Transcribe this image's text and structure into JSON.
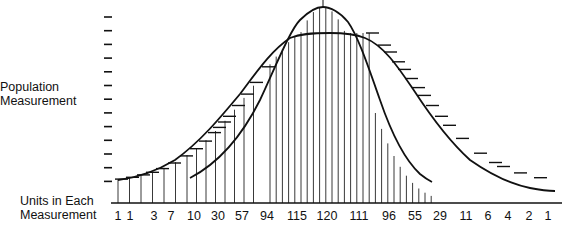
{
  "chart_data": {
    "type": "bar",
    "title": "",
    "ylabel": "Population Measurement",
    "xlabel": "Units in Each Measurement",
    "categories": [
      "1",
      "1",
      "3",
      "7",
      "10",
      "30",
      "57",
      "94",
      "115",
      "120",
      "111",
      "96",
      "55",
      "29",
      "11",
      "6",
      "4",
      "2",
      "1"
    ],
    "values": [
      1,
      1,
      3,
      7,
      10,
      30,
      57,
      94,
      115,
      120,
      111,
      96,
      55,
      29,
      11,
      6,
      4,
      2,
      1
    ],
    "series": [
      {
        "name": "Wide distribution curve (with tick marks)",
        "type": "line"
      },
      {
        "name": "Narrow distribution curve (peaked)",
        "type": "line"
      }
    ],
    "y_ticks_count": 13,
    "grid": false,
    "legend": null
  },
  "labels": {
    "y_axis_line1": "Population",
    "y_axis_line2": "Measurement",
    "x_axis_line1": "Units in Each",
    "x_axis_line2": "Measurement"
  },
  "bottom_numbers": [
    {
      "text": "1",
      "x": 118
    },
    {
      "text": "1",
      "x": 130
    },
    {
      "text": "3",
      "x": 154
    },
    {
      "text": "7",
      "x": 171
    },
    {
      "text": "10",
      "x": 194
    },
    {
      "text": "30",
      "x": 218
    },
    {
      "text": "57",
      "x": 242
    },
    {
      "text": "94",
      "x": 267
    },
    {
      "text": "115",
      "x": 297
    },
    {
      "text": "120",
      "x": 327
    },
    {
      "text": "111",
      "x": 359
    },
    {
      "text": "96",
      "x": 389
    },
    {
      "text": "55",
      "x": 415
    },
    {
      "text": "29",
      "x": 440
    },
    {
      "text": "11",
      "x": 466
    },
    {
      "text": "6",
      "x": 488
    },
    {
      "text": "4",
      "x": 508
    },
    {
      "text": "2",
      "x": 529
    },
    {
      "text": "1",
      "x": 548
    }
  ]
}
